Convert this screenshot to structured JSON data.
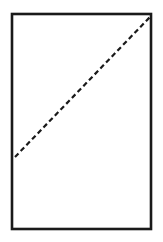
{
  "figure": {
    "kind": "geometric-diagram",
    "background_color": "#ffffff",
    "canvas": {
      "width": 163,
      "height": 242
    },
    "shapes": {
      "rectangle": {
        "name": "outer-rectangle",
        "x": 12,
        "y": 14,
        "width": 139,
        "height": 215,
        "stroke_color": "#1a1a1a",
        "stroke_width": 2.6,
        "fill_color": "#ffffff"
      },
      "diagonal": {
        "name": "dashed-diagonal-line",
        "x1": 15,
        "y1": 157,
        "x2": 150,
        "y2": 17,
        "stroke_color": "#1a1a1a",
        "stroke_width": 2.2,
        "dash_length": 5,
        "gap_length": 3.2,
        "line_style": "dashed"
      }
    },
    "labels": [],
    "text": []
  }
}
